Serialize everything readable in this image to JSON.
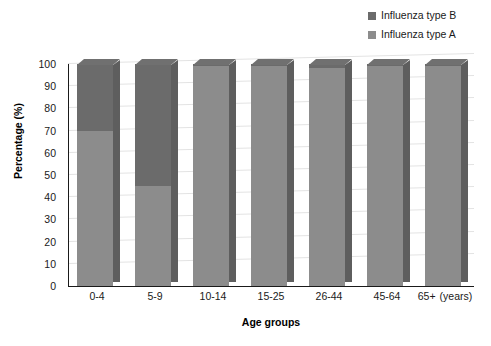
{
  "chart_data": {
    "type": "bar",
    "subtype": "stacked-bar-3d",
    "title": "",
    "subtitle": "",
    "xlabel": "Age groups",
    "ylabel": "Percentage (%)",
    "x_unit_note": "(years)",
    "categories": [
      "0-4",
      "5-9",
      "10-14",
      "15-25",
      "26-44",
      "45-64",
      "65+"
    ],
    "series": [
      {
        "name": "Influenza type A",
        "color": "#8c8c8c",
        "values": [
          70,
          45,
          99,
          99,
          98,
          99,
          99
        ]
      },
      {
        "name": "Influenza type B",
        "color": "#6b6b6b",
        "values": [
          30,
          55,
          1,
          1,
          2,
          1,
          1
        ]
      }
    ],
    "stack_order_bottom_to_top": [
      "Influenza type A",
      "Influenza type B"
    ],
    "ylim": [
      0,
      100
    ],
    "y_ticks": [
      0,
      10,
      20,
      30,
      40,
      50,
      60,
      70,
      80,
      90,
      100
    ],
    "y_tick_labels": [
      "0",
      "10",
      "20",
      "30",
      "40",
      "50",
      "60",
      "70",
      "80",
      "90",
      "100"
    ],
    "grid": true,
    "grid_axis": "y",
    "legend_position": "top-right",
    "legend_entries": [
      "Influenza type B",
      "Influenza type A"
    ],
    "background": "#ffffff",
    "axis_color": "#1a1a1a",
    "grid_color": "#e3e3e3"
  },
  "legend": {
    "items": [
      {
        "label": "Influenza type B",
        "color": "#6b6b6b"
      },
      {
        "label": "Influenza type A",
        "color": "#8c8c8c"
      }
    ]
  },
  "axes": {
    "y_title": "Percentage (%)",
    "x_title": "Age groups",
    "x_unit": "(years)",
    "y_labels": [
      "100",
      "90",
      "80",
      "70",
      "60",
      "50",
      "40",
      "30",
      "20",
      "10",
      "0"
    ],
    "x_labels": [
      "0-4",
      "5-9",
      "10-14",
      "15-25",
      "26-44",
      "45-64",
      "65+"
    ]
  }
}
